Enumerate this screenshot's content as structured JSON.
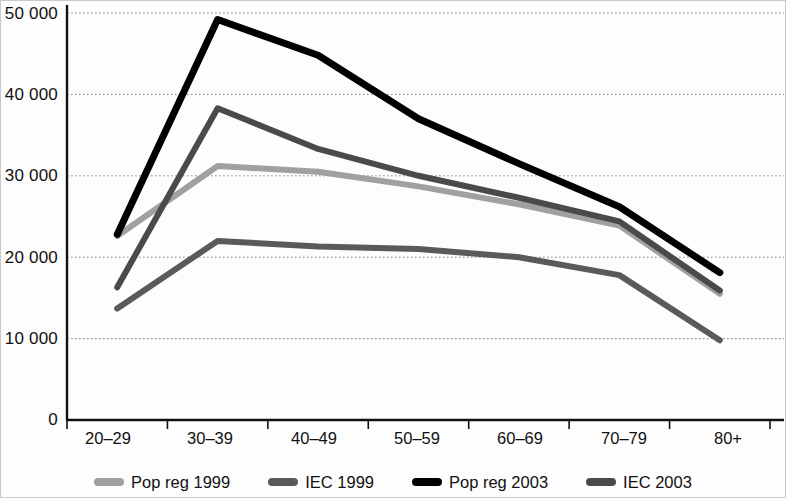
{
  "chart_data": {
    "type": "line",
    "title": "",
    "subtitle": "",
    "xlabel": "",
    "ylabel": "",
    "categories": [
      "20–29",
      "30–39",
      "40–49",
      "50–59",
      "60–69",
      "70–79",
      "80+"
    ],
    "ylim": [
      0,
      50000
    ],
    "ytick_values": [
      0,
      10000,
      20000,
      30000,
      40000,
      50000
    ],
    "ytick_labels": [
      "0",
      "10 000",
      "20 000",
      "30 000",
      "40 000",
      "50 000"
    ],
    "grid": "horizontal-dotted",
    "legend_position": "bottom",
    "series": [
      {
        "name": "Pop reg 1999",
        "color": "#a0a0a0",
        "values": [
          22600,
          31200,
          30500,
          28700,
          26500,
          23900,
          15500
        ]
      },
      {
        "name": "IEC 1999",
        "color": "#5a5a5a",
        "values": [
          13700,
          22000,
          21300,
          21000,
          20000,
          17800,
          9800
        ]
      },
      {
        "name": "Pop reg 2003",
        "color": "#000000",
        "values": [
          22800,
          49200,
          44800,
          37000,
          31500,
          26200,
          18100
        ]
      },
      {
        "name": "IEC 2003",
        "color": "#4a4a4a",
        "values": [
          16300,
          38300,
          33300,
          30000,
          27300,
          24400,
          15900
        ]
      }
    ]
  },
  "axis": {
    "y_labels": [
      "50 000",
      "40 000",
      "30 000",
      "20 000",
      "10 000",
      "0"
    ],
    "x_labels": [
      "20–29",
      "30–39",
      "40–49",
      "50–59",
      "60–69",
      "70–79",
      "80+"
    ]
  },
  "legend": {
    "items": [
      {
        "label": "Pop reg 1999",
        "color": "#a0a0a0"
      },
      {
        "label": "IEC 1999",
        "color": "#5a5a5a"
      },
      {
        "label": "Pop reg 2003",
        "color": "#000000"
      },
      {
        "label": "IEC 2003",
        "color": "#4a4a4a"
      }
    ]
  }
}
